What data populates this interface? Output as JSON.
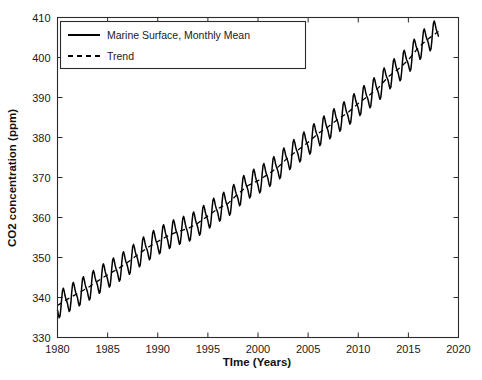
{
  "chart_data": {
    "type": "line",
    "title": "",
    "xlabel": "TIme (Years)",
    "ylabel": "CO2 concentration (ppm)",
    "xlim": [
      1980,
      2020
    ],
    "ylim": [
      330,
      410
    ],
    "xticks": [
      1980,
      1985,
      1990,
      1995,
      2000,
      2005,
      2010,
      2015,
      2020
    ],
    "xtick_labels": [
      "1980",
      "1985",
      "1990",
      "1995",
      "2000",
      "2005",
      "2010",
      "2015",
      "2020"
    ],
    "yticks": [
      330,
      340,
      350,
      360,
      370,
      380,
      390,
      400,
      410
    ],
    "ytick_labels": [
      "330",
      "340",
      "350",
      "360",
      "370",
      "380",
      "390",
      "400",
      "410"
    ],
    "grid": false,
    "legend_position": "upper left",
    "box": true,
    "series": [
      {
        "name": "Marine Surface, Monthly Mean",
        "style": "solid",
        "color": "#000000",
        "description": "Monthly mean marine surface CO2 with seasonal oscillation of about 3 ppm peak-to-peak superimposed on a rising trend",
        "x_start": 1980.0,
        "x_end": 2018.0,
        "seasonal_amplitude_ppm": 3.0,
        "seasonal_period_years": 1.0,
        "x": [
          1980.0,
          1981.0,
          1982.0,
          1983.0,
          1984.0,
          1985.0,
          1986.0,
          1987.0,
          1988.0,
          1989.0,
          1990.0,
          1991.0,
          1992.0,
          1993.0,
          1994.0,
          1995.0,
          1996.0,
          1997.0,
          1998.0,
          1999.0,
          2000.0,
          2001.0,
          2002.0,
          2003.0,
          2004.0,
          2005.0,
          2006.0,
          2007.0,
          2008.0,
          2009.0,
          2010.0,
          2011.0,
          2012.0,
          2013.0,
          2014.0,
          2015.0,
          2016.0,
          2017.0,
          2018.0
        ],
        "trend_values": [
          338.0,
          339.6,
          341.0,
          342.4,
          344.1,
          345.7,
          347.1,
          348.8,
          350.7,
          352.5,
          354.0,
          355.4,
          356.5,
          357.2,
          358.6,
          360.4,
          362.2,
          363.5,
          365.9,
          368.0,
          369.2,
          370.8,
          372.6,
          375.0,
          376.9,
          378.8,
          381.0,
          382.7,
          384.6,
          386.3,
          388.5,
          390.4,
          392.4,
          395.2,
          397.1,
          399.4,
          402.5,
          404.7,
          406.5
        ],
        "monthly_values_note": "Each year oscillates roughly +3 ppm in May and -3 ppm in September-October around the trend value"
      },
      {
        "name": "Trend",
        "style": "dashed",
        "color": "#000000",
        "description": "Smooth long-term trend through the monthly mean data",
        "x": [
          1980.0,
          2018.0
        ],
        "values": [
          338.0,
          406.5
        ]
      }
    ],
    "legend_entries": [
      {
        "label": "Marine Surface, Monthly Mean",
        "style": "solid"
      },
      {
        "label": "Trend",
        "style": "dashed"
      }
    ]
  }
}
